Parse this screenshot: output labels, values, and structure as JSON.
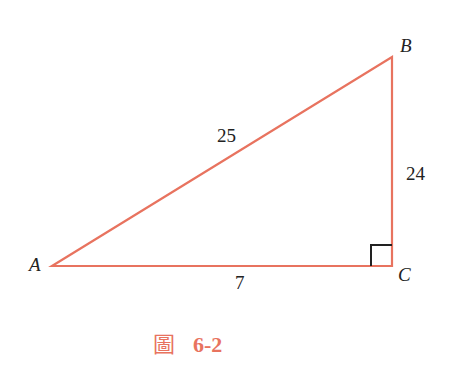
{
  "figure": {
    "caption_prefix": "圖",
    "caption_number": "6-2",
    "stroke_color": "#e8735f",
    "right_angle_color": "#222222",
    "vertices": {
      "A": {
        "label": "A",
        "x": 52,
        "y": 266
      },
      "B": {
        "label": "B",
        "x": 392,
        "y": 57
      },
      "C": {
        "label": "C",
        "x": 392,
        "y": 266
      }
    },
    "sides": {
      "AB": {
        "label": "25"
      },
      "BC": {
        "label": "24"
      },
      "AC": {
        "label": "7"
      }
    },
    "right_angle_at": "C"
  }
}
